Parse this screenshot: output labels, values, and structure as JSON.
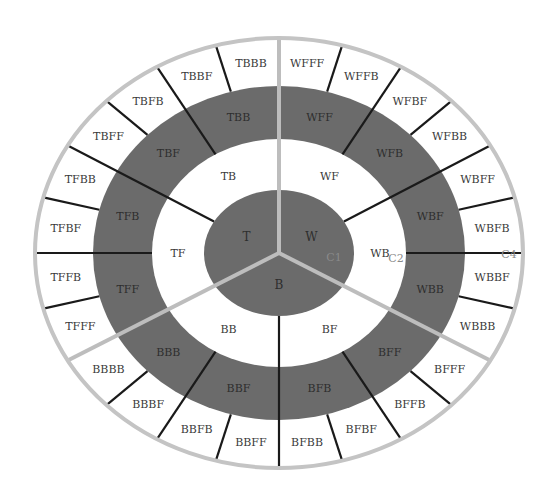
{
  "diagram": {
    "title": "",
    "colors": {
      "background": "#ffffff",
      "dark_ring": "#6b6b6b",
      "light_ring": "#ffffff",
      "outer_border": "#c4c4c4",
      "sector_separator": "#bdbdbd",
      "divider": "#1a1a1a",
      "text": "#3a3a3a",
      "connector_text": "#8a8a8a"
    },
    "geometry": {
      "cx": 279,
      "cy": 253,
      "radii": {
        "outer": [
          244,
          215
        ],
        "ring3_outer": [
          186,
          167
        ],
        "ring3_inner": [
          127,
          114
        ],
        "center": [
          75,
          63
        ]
      }
    },
    "level1": [
      {
        "label": "T",
        "start": 90,
        "end": 210
      },
      {
        "label": "W",
        "start": -30,
        "end": 90
      },
      {
        "label": "B",
        "start": 210,
        "end": 330
      }
    ],
    "level2": [
      {
        "label": "TB",
        "start": 90,
        "end": 150
      },
      {
        "label": "TF",
        "start": 150,
        "end": 210
      },
      {
        "label": "WF",
        "start": 30,
        "end": 90
      },
      {
        "label": "WB",
        "start": -30,
        "end": 30
      },
      {
        "label": "BB",
        "start": 210,
        "end": 270
      },
      {
        "label": "BF",
        "start": 270,
        "end": 330
      }
    ],
    "level3": [
      {
        "label": "TBB",
        "start": 90,
        "end": 120
      },
      {
        "label": "TBF",
        "start": 120,
        "end": 150
      },
      {
        "label": "TFB",
        "start": 150,
        "end": 180
      },
      {
        "label": "TFF",
        "start": 180,
        "end": 210
      },
      {
        "label": "WFF",
        "start": 60,
        "end": 90
      },
      {
        "label": "WFB",
        "start": 30,
        "end": 60
      },
      {
        "label": "WBF",
        "start": 0,
        "end": 30
      },
      {
        "label": "WBB",
        "start": -30,
        "end": 0
      },
      {
        "label": "BBB",
        "start": 210,
        "end": 240
      },
      {
        "label": "BBF",
        "start": 240,
        "end": 270
      },
      {
        "label": "BFB",
        "start": 270,
        "end": 300
      },
      {
        "label": "BFF",
        "start": 300,
        "end": 330
      }
    ],
    "level4": [
      {
        "label": "TBBB",
        "start": 90,
        "end": 105
      },
      {
        "label": "TBBF",
        "start": 105,
        "end": 120
      },
      {
        "label": "TBFB",
        "start": 120,
        "end": 135
      },
      {
        "label": "TBFF",
        "start": 135,
        "end": 150
      },
      {
        "label": "TFBB",
        "start": 150,
        "end": 165
      },
      {
        "label": "TFBF",
        "start": 165,
        "end": 180
      },
      {
        "label": "TFFB",
        "start": 180,
        "end": 195
      },
      {
        "label": "TFFF",
        "start": 195,
        "end": 210
      },
      {
        "label": "WFFF",
        "start": 75,
        "end": 90
      },
      {
        "label": "WFFB",
        "start": 60,
        "end": 75
      },
      {
        "label": "WFBF",
        "start": 45,
        "end": 60
      },
      {
        "label": "WFBB",
        "start": 30,
        "end": 45
      },
      {
        "label": "WBFF",
        "start": 15,
        "end": 30
      },
      {
        "label": "WBFB",
        "start": 0,
        "end": 15
      },
      {
        "label": "WBBF",
        "start": -15,
        "end": 0
      },
      {
        "label": "WBBB",
        "start": -30,
        "end": -15
      },
      {
        "label": "BBBB",
        "start": 210,
        "end": 225
      },
      {
        "label": "BBBF",
        "start": 225,
        "end": 240
      },
      {
        "label": "BBFB",
        "start": 240,
        "end": 255
      },
      {
        "label": "BBFF",
        "start": 255,
        "end": 270
      },
      {
        "label": "BFBB",
        "start": 270,
        "end": 285
      },
      {
        "label": "BFBF",
        "start": 285,
        "end": 300
      },
      {
        "label": "BFFB",
        "start": 300,
        "end": 315
      },
      {
        "label": "BFFF",
        "start": 315,
        "end": 330
      }
    ],
    "sector_separators": [
      90,
      210,
      330
    ],
    "dividers": [
      {
        "angle": 150,
        "from": "center"
      },
      {
        "angle": 30,
        "from": "center"
      },
      {
        "angle": 270,
        "from": "center"
      },
      {
        "angle": 120,
        "from": "ring3_inner"
      },
      {
        "angle": 180,
        "from": "ring3_inner"
      },
      {
        "angle": 60,
        "from": "ring3_inner"
      },
      {
        "angle": 0,
        "from": "ring3_inner"
      },
      {
        "angle": 240,
        "from": "ring3_inner"
      },
      {
        "angle": 300,
        "from": "ring3_inner"
      },
      {
        "angle": 105,
        "from": "ring3_outer"
      },
      {
        "angle": 135,
        "from": "ring3_outer"
      },
      {
        "angle": 165,
        "from": "ring3_outer"
      },
      {
        "angle": 195,
        "from": "ring3_outer"
      },
      {
        "angle": 75,
        "from": "ring3_outer"
      },
      {
        "angle": 45,
        "from": "ring3_outer"
      },
      {
        "angle": 15,
        "from": "ring3_outer"
      },
      {
        "angle": -15,
        "from": "ring3_outer"
      },
      {
        "angle": 225,
        "from": "ring3_outer"
      },
      {
        "angle": 255,
        "from": "ring3_outer"
      },
      {
        "angle": 285,
        "from": "ring3_outer"
      },
      {
        "angle": 315,
        "from": "ring3_outer"
      }
    ],
    "connector_labels": [
      {
        "label": "C1",
        "x": 334,
        "y": 257,
        "dark": true
      },
      {
        "label": "C2",
        "x": 396,
        "y": 258,
        "dark": false
      },
      {
        "label": "C4",
        "x": 509,
        "y": 254,
        "dark": false
      }
    ]
  }
}
